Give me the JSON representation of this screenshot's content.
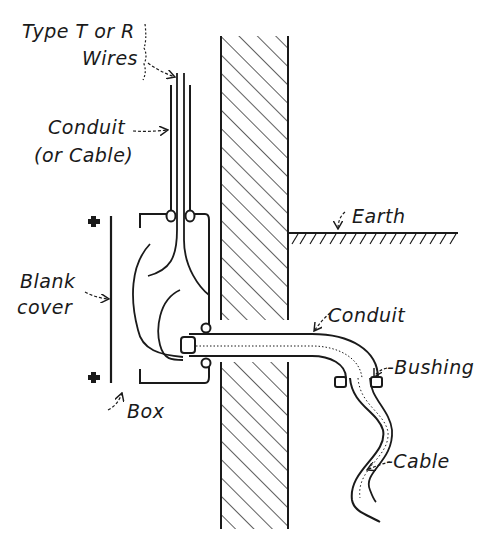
{
  "colors": {
    "ink": "#1a1a1a",
    "background": "#ffffff"
  },
  "labels": {
    "wires_line1": "Type T or R",
    "wires_line2": "Wires",
    "conduit_top_line1": "Conduit",
    "conduit_top_line2": "(or Cable)",
    "blank_cover_line1": "Blank",
    "blank_cover_line2": "cover",
    "box": "Box",
    "earth": "Earth",
    "conduit_right": "Conduit",
    "bushing": "-Bushing",
    "cable": "-Cable"
  },
  "components": [
    "type-t-or-r-wires",
    "vertical-conduit",
    "outlet-box",
    "blank-cover",
    "cover-screws",
    "wall-section",
    "earth-grade",
    "horizontal-conduit",
    "bushing",
    "flexible-cable"
  ]
}
